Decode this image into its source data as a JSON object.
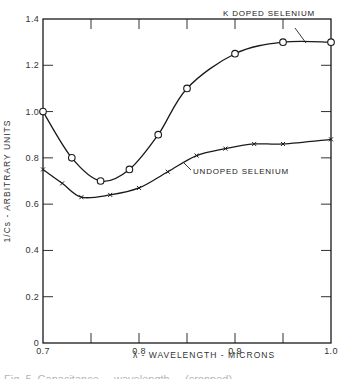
{
  "chart_data": {
    "type": "line",
    "title": "",
    "xlabel": "λ - WAVELENGTH - MICRONS",
    "ylabel": "1/Cs - ARBITRARY UNITS",
    "xlim": [
      0.7,
      1.0
    ],
    "ylim": [
      0,
      1.4
    ],
    "x_ticks": [
      {
        "value": 0.7,
        "label": "0.7"
      },
      {
        "value": 0.75,
        "label": ""
      },
      {
        "value": 0.8,
        "label": "0.8"
      },
      {
        "value": 0.85,
        "label": ""
      },
      {
        "value": 0.9,
        "label": "0.9"
      },
      {
        "value": 0.95,
        "label": ""
      },
      {
        "value": 1.0,
        "label": "1.0"
      }
    ],
    "y_ticks": [
      {
        "value": 0,
        "label": "0"
      },
      {
        "value": 0.2,
        "label": "0.2"
      },
      {
        "value": 0.4,
        "label": "0.4"
      },
      {
        "value": 0.6,
        "label": "0.6"
      },
      {
        "value": 0.8,
        "label": "0.8"
      },
      {
        "value": 1.0,
        "label": "1.0"
      },
      {
        "value": 1.2,
        "label": "1.2"
      },
      {
        "value": 1.4,
        "label": "1.4"
      }
    ],
    "grid": false,
    "legend_position": "inline annotations",
    "series": [
      {
        "name": "K DOPED SELENIUM",
        "marker": "circle",
        "x": [
          0.7,
          0.73,
          0.76,
          0.79,
          0.82,
          0.85,
          0.9,
          0.95,
          1.0
        ],
        "y": [
          1.0,
          0.8,
          0.7,
          0.75,
          0.9,
          1.1,
          1.25,
          1.3,
          1.3
        ]
      },
      {
        "name": "UNDOPED SELENIUM",
        "marker": "x",
        "x": [
          0.7,
          0.72,
          0.74,
          0.77,
          0.8,
          0.83,
          0.86,
          0.89,
          0.92,
          0.95,
          1.0
        ],
        "y": [
          0.75,
          0.69,
          0.63,
          0.64,
          0.67,
          0.74,
          0.81,
          0.84,
          0.86,
          0.86,
          0.88
        ]
      }
    ],
    "annotations": [
      {
        "text": "K DOPED SELENIUM",
        "points_to_series": 0
      },
      {
        "text": "UNDOPED SELENIUM",
        "points_to_series": 1
      }
    ]
  },
  "caption": "Fig. 5. Capacitance ... wavelength ... (cropped)",
  "colors": {
    "ink": "#1a1a1a",
    "background": "#ffffff"
  }
}
